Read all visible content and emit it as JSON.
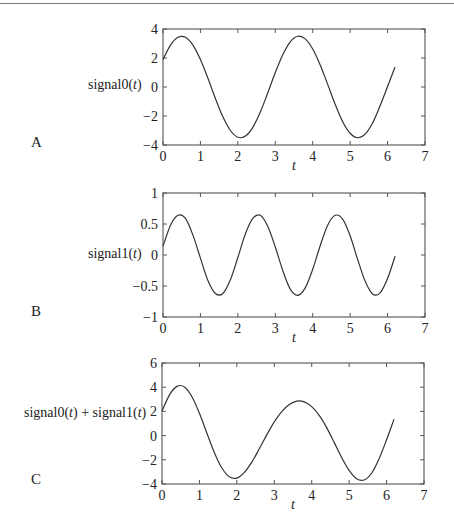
{
  "chart_data": [
    {
      "type": "line",
      "panel": "A",
      "ylabel": "signal0(t)",
      "ylabel_parts": [
        "signal0(",
        "t",
        ")"
      ],
      "xlabel": "t",
      "xlim": [
        0,
        7
      ],
      "ylim": [
        -4,
        4
      ],
      "xticks": [
        0,
        1,
        2,
        3,
        4,
        5,
        6,
        7
      ],
      "yticks": [
        -4,
        -2,
        0,
        2,
        4
      ],
      "ytick_labels": [
        "−4",
        "−2",
        "0",
        "2",
        "4"
      ],
      "grid": false,
      "x": [
        0,
        0.2,
        0.4,
        0.6,
        0.8,
        1.0,
        1.2,
        1.4,
        1.6,
        1.8,
        2.0,
        2.2,
        2.4,
        2.6,
        2.8,
        3.0,
        3.2,
        3.4,
        3.6,
        3.8,
        4.0,
        4.2,
        4.4,
        4.6,
        4.8,
        5.0,
        5.2,
        5.4,
        5.6,
        5.8,
        6.0,
        6.2
      ],
      "values": [
        1.89,
        2.89,
        3.43,
        3.43,
        2.89,
        1.89,
        0.6,
        -0.79,
        -2.06,
        -3.0,
        -3.47,
        -3.38,
        -2.78,
        -1.73,
        -0.4,
        1.0,
        2.23,
        3.12,
        3.5,
        3.32,
        2.62,
        1.52,
        0.18,
        -1.2,
        -2.39,
        -3.19,
        -3.5,
        -3.25,
        -2.48,
        -1.3,
        0.04,
        1.38
      ]
    },
    {
      "type": "line",
      "panel": "B",
      "ylabel": "signal1(t)",
      "ylabel_parts": [
        "signal1(",
        "t",
        ")"
      ],
      "xlabel": "t",
      "xlim": [
        0,
        7
      ],
      "ylim": [
        -1,
        1
      ],
      "xticks": [
        0,
        1,
        2,
        3,
        4,
        5,
        6,
        7
      ],
      "yticks": [
        -1,
        -0.5,
        0,
        0.5,
        1
      ],
      "ytick_labels": [
        "−1",
        "−0.5",
        "0",
        "0.5",
        "1"
      ],
      "grid": false,
      "x": [
        0,
        0.2,
        0.4,
        0.6,
        0.8,
        1.0,
        1.2,
        1.4,
        1.6,
        1.8,
        2.0,
        2.2,
        2.4,
        2.6,
        2.8,
        3.0,
        3.2,
        3.4,
        3.6,
        3.8,
        4.0,
        4.2,
        4.4,
        4.6,
        4.8,
        5.0,
        5.2,
        5.4,
        5.6,
        5.8,
        6.0,
        6.2
      ],
      "values": [
        0.14,
        0.48,
        0.64,
        0.59,
        0.32,
        -0.05,
        -0.41,
        -0.62,
        -0.62,
        -0.4,
        -0.04,
        0.34,
        0.59,
        0.64,
        0.46,
        0.13,
        -0.25,
        -0.55,
        -0.65,
        -0.53,
        -0.23,
        0.15,
        0.48,
        0.64,
        0.58,
        0.31,
        -0.07,
        -0.42,
        -0.63,
        -0.61,
        -0.38,
        -0.02
      ]
    },
    {
      "type": "line",
      "panel": "C",
      "ylabel": "signal0(t) + signal1(t)",
      "ylabel_parts": [
        "signal0(",
        "t",
        ") + signal1(",
        "t",
        ")"
      ],
      "xlabel": "t",
      "xlim": [
        0,
        7
      ],
      "ylim": [
        -4,
        6
      ],
      "xticks": [
        0,
        1,
        2,
        3,
        4,
        5,
        6,
        7
      ],
      "yticks": [
        -4,
        -2,
        0,
        2,
        4,
        6
      ],
      "ytick_labels": [
        "−4",
        "−2",
        "0",
        "2",
        "4",
        "6"
      ],
      "grid": false,
      "x": [
        0,
        0.2,
        0.4,
        0.6,
        0.8,
        1.0,
        1.2,
        1.4,
        1.6,
        1.8,
        2.0,
        2.2,
        2.4,
        2.6,
        2.8,
        3.0,
        3.2,
        3.4,
        3.6,
        3.8,
        4.0,
        4.2,
        4.4,
        4.6,
        4.8,
        5.0,
        5.2,
        5.4,
        5.6,
        5.8,
        6.0,
        6.2
      ],
      "values": [
        2.03,
        3.37,
        4.07,
        4.02,
        3.21,
        1.84,
        0.19,
        -1.41,
        -2.68,
        -3.4,
        -3.51,
        -3.04,
        -2.19,
        -1.09,
        0.06,
        1.13,
        1.98,
        2.57,
        2.85,
        2.79,
        2.39,
        1.67,
        0.66,
        -0.56,
        -1.81,
        -2.88,
        -3.57,
        -3.67,
        -3.11,
        -1.91,
        -0.34,
        1.36
      ]
    }
  ],
  "panels": {
    "a": {
      "letter": "A",
      "ylabel_pre": "signal0(",
      "ylabel_t": "t",
      "ylabel_post": ")"
    },
    "b": {
      "letter": "B",
      "ylabel_pre": "signal1(",
      "ylabel_t": "t",
      "ylabel_post": ")"
    },
    "c": {
      "letter": "C",
      "ylabel_pre": "signal0(",
      "ylabel_t": "t",
      "ylabel_mid": ") + signal1(",
      "ylabel_t2": "t",
      "ylabel_post": ")"
    }
  },
  "colors": {
    "line": "#333333",
    "axis": "#555555",
    "background": "#ffffff"
  }
}
